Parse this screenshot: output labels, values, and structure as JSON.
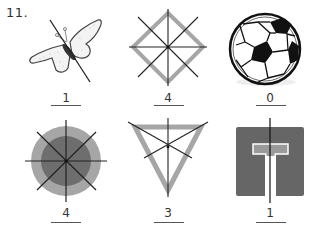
{
  "question": {
    "number": "11."
  },
  "figures": [
    {
      "name": "butterfly",
      "answer": "1",
      "symmetry_lines": 1
    },
    {
      "name": "diamond-square",
      "answer": "4",
      "symmetry_lines": 4
    },
    {
      "name": "soccer-ball",
      "answer": "0",
      "symmetry_lines": 0
    },
    {
      "name": "concentric-circles",
      "answer": "4",
      "symmetry_lines": 4
    },
    {
      "name": "inverted-triangle",
      "answer": "3",
      "symmetry_lines": 3
    },
    {
      "name": "t-in-square",
      "answer": "1",
      "symmetry_lines": 1
    }
  ],
  "colors": {
    "line": "#222222",
    "light_gray": "#a6a6a6",
    "mid_gray": "#8c8c8c",
    "dark_gray": "#666666"
  }
}
